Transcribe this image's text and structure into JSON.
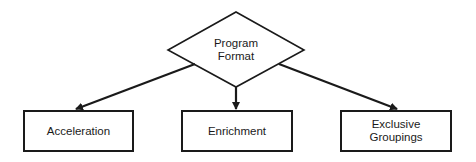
{
  "diagram": {
    "type": "flowchart",
    "root": {
      "id": "program-format",
      "shape": "diamond",
      "label": "Program\nFormat"
    },
    "children": [
      {
        "id": "acceleration",
        "shape": "rectangle",
        "label": "Acceleration"
      },
      {
        "id": "enrichment",
        "shape": "rectangle",
        "label": "Enrichment"
      },
      {
        "id": "exclusive-groupings",
        "shape": "rectangle",
        "label": "Exclusive\nGroupings"
      }
    ],
    "edges": [
      {
        "from": "program-format",
        "to": "acceleration"
      },
      {
        "from": "program-format",
        "to": "enrichment"
      },
      {
        "from": "program-format",
        "to": "exclusive-groupings"
      }
    ],
    "colors": {
      "stroke": "#1a1a1a",
      "background": "#ffffff"
    }
  }
}
